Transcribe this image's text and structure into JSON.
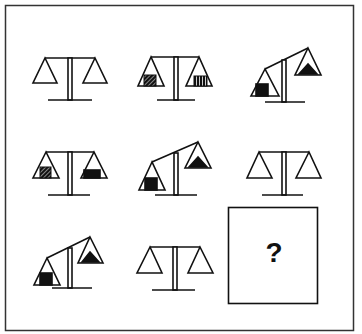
{
  "puzzle": {
    "type": "matrix-reasoning",
    "grid": {
      "rows": 3,
      "cols": 3
    },
    "answer_placeholder": "?",
    "colors": {
      "ink": "#111111",
      "paper": "#ffffff",
      "frame": "#333333"
    },
    "cells": [
      {
        "row": 1,
        "col": 1,
        "state": "balanced",
        "left_pan": "empty",
        "right_pan": "empty"
      },
      {
        "row": 1,
        "col": 2,
        "state": "balanced",
        "left_pan": "square-diagonal-hatch",
        "right_pan": "square-vertical-stripes"
      },
      {
        "row": 1,
        "col": 3,
        "state": "tilted-left-down",
        "left_pan": "square-solid",
        "right_pan": "triangle-solid"
      },
      {
        "row": 2,
        "col": 1,
        "state": "balanced",
        "left_pan": "square-diagonal-hatch",
        "right_pan": "square-solid"
      },
      {
        "row": 2,
        "col": 2,
        "state": "tilted-left-down",
        "left_pan": "square-solid",
        "right_pan": "triangle-solid"
      },
      {
        "row": 2,
        "col": 3,
        "state": "balanced",
        "left_pan": "empty",
        "right_pan": "empty"
      },
      {
        "row": 3,
        "col": 1,
        "state": "tilted-left-down",
        "left_pan": "square-solid",
        "right_pan": "triangle-solid"
      },
      {
        "row": 3,
        "col": 2,
        "state": "balanced",
        "left_pan": "empty",
        "right_pan": "empty"
      },
      {
        "row": 3,
        "col": 3,
        "state": "unknown",
        "left_pan": "",
        "right_pan": ""
      }
    ]
  }
}
